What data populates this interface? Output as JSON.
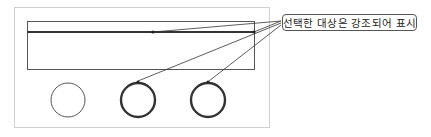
{
  "diagram": {
    "callout": {
      "label": "선택한 대상은 강조되어 표시"
    },
    "colors": {
      "frame": "#cfcfcf",
      "rect": "#555555",
      "highlight": "#333333",
      "normal": "#444444",
      "leader": "#333333"
    },
    "shapes": {
      "outer_frame": {
        "x": 14,
        "y": 7,
        "w": 255,
        "h": 120
      },
      "inner_rect": {
        "x": 27,
        "y": 21,
        "w": 227,
        "h": 48
      },
      "highlighted_line": {
        "x1": 27,
        "y1": 32,
        "x2": 254,
        "y2": 32
      },
      "circles": [
        {
          "cx": 68,
          "cy": 100,
          "r": 17,
          "highlighted": false
        },
        {
          "cx": 138,
          "cy": 100,
          "r": 17,
          "highlighted": true
        },
        {
          "cx": 208,
          "cy": 100,
          "r": 17,
          "highlighted": true
        }
      ]
    }
  }
}
